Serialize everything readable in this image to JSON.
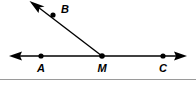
{
  "figure": {
    "kind": "geometry-diagram",
    "background_color": "#ffffff",
    "ink_color": "#000000",
    "divider_color": "#9a9a9a",
    "width": 196,
    "height": 85,
    "points": [
      {
        "id": "A",
        "label": "A",
        "x": 41,
        "y": 56,
        "label_x": 41,
        "label_y": 72
      },
      {
        "id": "B",
        "label": "B",
        "x": 53,
        "y": 15,
        "label_x": 65,
        "label_y": 13
      },
      {
        "id": "M",
        "label": "M",
        "x": 102,
        "y": 56,
        "label_x": 102,
        "label_y": 72
      },
      {
        "id": "C",
        "label": "C",
        "x": 163,
        "y": 56,
        "label_x": 163,
        "label_y": 72
      }
    ],
    "lines": [
      {
        "id": "line-AC",
        "name": "horizontal-line-AC",
        "x1": 12,
        "y1": 56,
        "x2": 184,
        "y2": 56,
        "arrow_start": true,
        "arrow_end": true
      },
      {
        "id": "ray-MB",
        "name": "ray-MB",
        "x1": 102,
        "y1": 56,
        "x2": 34,
        "y2": 4,
        "arrow_start": false,
        "arrow_end": true
      }
    ],
    "divider": {
      "x1": 0,
      "y1": 79.5,
      "x2": 196,
      "y2": 79.5
    }
  }
}
